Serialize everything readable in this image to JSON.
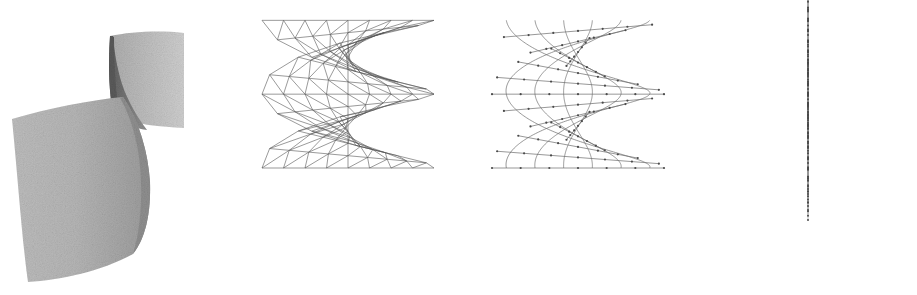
{
  "figure": {
    "width": 917,
    "height": 295,
    "background_color": "#ffffff",
    "panel_count": 4
  },
  "palette": {
    "background": "#ffffff",
    "surface_light": "#c9c9c9",
    "surface_mid": "#a8a8a8",
    "surface_dark": "#6e6e6e",
    "surface_darkest": "#5a5a5a",
    "wireframe_line": "#555555",
    "curve_line": "#6b6b6b",
    "marker_fill": "#4a4a4a",
    "ruling_line": "#8a8a8a"
  },
  "panels": [
    {
      "id": "panel-1",
      "index": 1,
      "name": "shaded-surface",
      "label": "Shaded helicoid surface",
      "render_mode": "shaded",
      "x": 0,
      "width": 230,
      "description": "Grayscale dithered shaded spiral ramp with a dark inner fold band",
      "shading": {
        "upper_flap_fill": "#bdbdbd",
        "inner_fold_fill": "#6e6e6e",
        "lower_flap_fill": "#b5b5b5",
        "right_band_fill": "#c4c4c4",
        "noise": "dither"
      }
    },
    {
      "id": "panel-2",
      "index": 2,
      "name": "triangulated-wireframe",
      "label": "Triangulated wireframe mesh",
      "render_mode": "wireframe",
      "x": 230,
      "width": 230,
      "description": "Quad mesh with one diagonal per cell forming triangles",
      "mesh": {
        "u_divisions": 12,
        "v_divisions": 8,
        "diagonal": true,
        "stroke": "#555555",
        "stroke_width": 0.6
      }
    },
    {
      "id": "panel-3",
      "index": 3,
      "name": "isoparametric-curves",
      "label": "Isoparametric curves with sample points",
      "render_mode": "curves",
      "x": 460,
      "width": 230,
      "description": "Helical v-curves interwoven with near-horizontal radial u-lines, dot markers at samples",
      "curves": {
        "helix_count": 6,
        "radial_count": 14,
        "markers_per_radial": 6,
        "stroke": "#6b6b6b",
        "stroke_width": 0.7,
        "marker_radius": 1.1,
        "marker_fill": "#4a4a4a"
      }
    },
    {
      "id": "panel-4",
      "index": 4,
      "name": "vertical-rulings",
      "label": "Vertical ruling segments with knots",
      "render_mode": "rulings",
      "x": 690,
      "width": 227,
      "description": "Vertical line segments, widely spaced at left and right, densely clustered in the centre, each carrying evenly spaced dot markers",
      "rulings": {
        "segment_count": 14,
        "markers_per_segment": 12,
        "stroke": "#8a8a8a",
        "stroke_width": 0.6,
        "marker_radius": 1.0,
        "marker_fill": "#4a4a4a"
      }
    }
  ],
  "chart_data": {
    "type": "line",
    "xlabel": "",
    "ylabel": "",
    "surface": {
      "name": "helicoid",
      "parametric_form": "x = r*cos(t), y = r*sin(t), z = c*t",
      "u_range": [
        -1,
        1
      ],
      "v_range": [
        0,
        6.283185
      ],
      "turns": 1.0
    },
    "series": [
      {
        "name": "shaded-surface",
        "panel": 1,
        "representation": "filled grayscale"
      },
      {
        "name": "triangulated-mesh",
        "panel": 2,
        "representation": "wireframe triangles"
      },
      {
        "name": "isoparametric-curves",
        "panel": 3,
        "representation": "curves + point markers"
      },
      {
        "name": "vertical-rulings",
        "panel": 4,
        "representation": "line segments + point markers"
      }
    ],
    "legend": "none",
    "grid": false
  }
}
